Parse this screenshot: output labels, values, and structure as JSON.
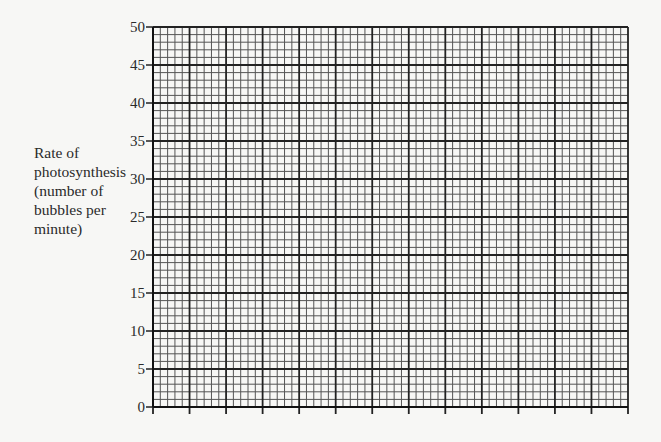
{
  "chart_data": {
    "type": "line",
    "title": "",
    "xlabel": "",
    "ylabel": "Rate of photosynthesis (number of bubbles per minute)",
    "ylabel_lines": [
      "Rate of",
      "photosynthesis",
      "(number of",
      "bubbles per",
      "minute)"
    ],
    "ylim": [
      0,
      50
    ],
    "y_ticks": [
      0,
      5,
      10,
      15,
      20,
      25,
      30,
      35,
      40,
      45,
      50
    ],
    "x_ticks": [],
    "x_major_divisions": 13,
    "x_minor_per_major": 5,
    "y_minor_per_major": 5,
    "grid": true,
    "series": [],
    "legend": null,
    "note": "Blank graph-paper template; no data plotted"
  }
}
